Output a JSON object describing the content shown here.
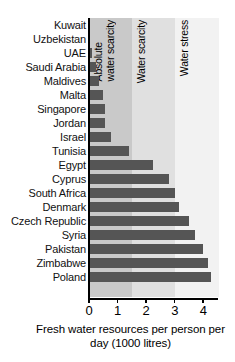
{
  "chart_data": {
    "type": "bar",
    "orientation": "horizontal",
    "title": "",
    "xlabel": "Fresh water resources per person per day (1000 litres)",
    "ylabel": "",
    "xlim": [
      0,
      4.55
    ],
    "xticks": [
      0,
      1,
      2,
      3,
      4
    ],
    "xtick_labels": [
      "0",
      "1",
      "2",
      "3",
      "4"
    ],
    "grid": false,
    "legend": "none",
    "bar_color": "#555555",
    "categories": [
      "Kuwait",
      "Uzbekistan",
      "UAE",
      "Saudi Arabia",
      "Maldives",
      "Malta",
      "Singapore",
      "Jordan",
      "Israel",
      "Tunisia",
      "Egypt",
      "Cyprus",
      "South Africa",
      "Denmark",
      "Czech Republic",
      "Syria",
      "Pakistan",
      "Zimbabwe",
      "Poland"
    ],
    "values": [
      0.03,
      0.05,
      0.1,
      0.25,
      0.35,
      0.5,
      0.55,
      0.55,
      0.78,
      1.4,
      2.25,
      2.8,
      3.0,
      3.15,
      3.5,
      3.7,
      4.0,
      4.15,
      4.28
    ],
    "annotations": [
      {
        "name": "absolute-water-scarcity",
        "label": "Absolute\nwater scarcity",
        "x_start": 0,
        "x_end": 1.5,
        "band_color": "#c9c9c9"
      },
      {
        "name": "water-scarcity",
        "label": "Water scarcity",
        "x_start": 1.5,
        "x_end": 3.0,
        "band_color": "#e0e0e0"
      },
      {
        "name": "water-stress",
        "label": "Water stress",
        "x_start": 3.0,
        "x_end": 4.55,
        "band_color": "#f2f2f2"
      }
    ]
  }
}
